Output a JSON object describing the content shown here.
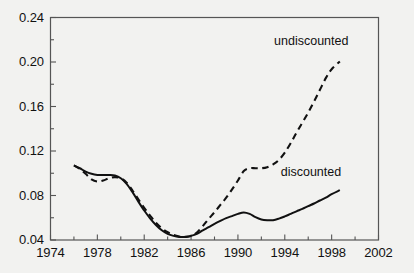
{
  "chart_data": {
    "type": "line",
    "title": "",
    "xlabel": "",
    "ylabel": "",
    "xlim": [
      1974,
      2002
    ],
    "ylim": [
      0.04,
      0.24
    ],
    "grid": false,
    "legend_position": "inline-annotations",
    "x_ticks": [
      "1974",
      "1978",
      "1982",
      "1986",
      "1990",
      "1994",
      "1998",
      "2002"
    ],
    "x_tick_values": [
      1974,
      1978,
      1982,
      1986,
      1990,
      1994,
      1998,
      2002
    ],
    "x_minor_ticks": [
      1976,
      1980,
      1984,
      1988,
      1992,
      1996,
      2000
    ],
    "y_ticks": [
      "0.04",
      "0.08",
      "0.12",
      "0.16",
      "0.20",
      "0.24"
    ],
    "y_tick_values": [
      0.04,
      0.08,
      0.12,
      0.16,
      0.2,
      0.24
    ],
    "y_minor_ticks": [
      0.06,
      0.1,
      0.14,
      0.18,
      0.22
    ],
    "annotations": [
      {
        "text": "undiscounted",
        "x": 1996.5,
        "y": 0.218
      },
      {
        "text": "discounted",
        "x": 1996.3,
        "y": 0.1
      },
      {
        "text": "0.24"
      },
      {
        "text": "0.04"
      }
    ],
    "series": [
      {
        "name": "undiscounted",
        "style": "dashed",
        "color": "#111111",
        "x": [
          1976.0,
          1976.5,
          1977.0,
          1977.5,
          1978.0,
          1978.5,
          1979.0,
          1979.5,
          1980.0,
          1980.5,
          1981.0,
          1981.5,
          1982.0,
          1982.5,
          1983.0,
          1983.5,
          1984.0,
          1984.5,
          1985.0,
          1985.5,
          1986.0,
          1986.5,
          1987.0,
          1987.5,
          1988.0,
          1988.5,
          1989.0,
          1989.5,
          1990.0,
          1990.5,
          1991.0,
          1991.5,
          1992.0,
          1992.5,
          1993.0,
          1993.5,
          1994.0,
          1994.5,
          1995.0,
          1995.5,
          1996.0,
          1996.5,
          1997.0,
          1997.5,
          1998.0,
          1998.7
        ],
        "y": [
          0.107,
          0.104,
          0.0995,
          0.0945,
          0.0925,
          0.0935,
          0.0955,
          0.0965,
          0.0955,
          0.0915,
          0.0845,
          0.0765,
          0.069,
          0.062,
          0.0555,
          0.0505,
          0.047,
          0.0445,
          0.0432,
          0.0428,
          0.0435,
          0.0468,
          0.0525,
          0.059,
          0.065,
          0.0715,
          0.078,
          0.0855,
          0.0935,
          0.102,
          0.1045,
          0.1045,
          0.1045,
          0.1055,
          0.108,
          0.112,
          0.1185,
          0.127,
          0.1365,
          0.1455,
          0.1545,
          0.1645,
          0.175,
          0.1855,
          0.1935,
          0.2005
        ]
      },
      {
        "name": "discounted",
        "style": "solid",
        "color": "#111111",
        "x": [
          1976.0,
          1976.5,
          1977.0,
          1977.5,
          1978.0,
          1978.5,
          1979.0,
          1979.5,
          1980.0,
          1980.5,
          1981.0,
          1981.5,
          1982.0,
          1982.5,
          1983.0,
          1983.5,
          1984.0,
          1984.5,
          1985.0,
          1985.5,
          1986.0,
          1986.5,
          1987.0,
          1987.5,
          1988.0,
          1988.5,
          1989.0,
          1989.5,
          1990.0,
          1990.5,
          1991.0,
          1991.5,
          1992.0,
          1992.5,
          1993.0,
          1993.5,
          1994.0,
          1994.5,
          1995.0,
          1995.5,
          1996.0,
          1996.5,
          1997.0,
          1997.5,
          1998.0,
          1998.7
        ],
        "y": [
          0.107,
          0.1045,
          0.1015,
          0.0995,
          0.0985,
          0.0985,
          0.0985,
          0.098,
          0.0955,
          0.0905,
          0.083,
          0.0745,
          0.0665,
          0.0595,
          0.0535,
          0.0487,
          0.0455,
          0.0437,
          0.0428,
          0.0428,
          0.0437,
          0.0455,
          0.0487,
          0.0515,
          0.0545,
          0.0572,
          0.0597,
          0.0615,
          0.0635,
          0.0648,
          0.0635,
          0.0605,
          0.0585,
          0.0578,
          0.0578,
          0.0592,
          0.0612,
          0.0635,
          0.0658,
          0.068,
          0.0705,
          0.0728,
          0.0755,
          0.078,
          0.0812,
          0.0848
        ]
      }
    ]
  },
  "axes": {
    "frame_color": "#555555",
    "tick_color": "#555555"
  }
}
